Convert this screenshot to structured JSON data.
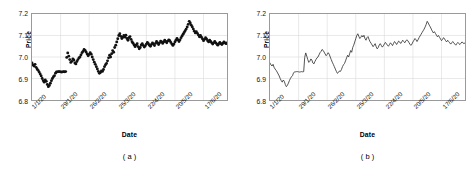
{
  "figure": {
    "panels": [
      {
        "id": "a",
        "caption": "( a )",
        "chart_index": 0
      },
      {
        "id": "b",
        "caption": "( b )",
        "chart_index": 1
      }
    ]
  },
  "axis": {
    "ylabel": "Price",
    "xlabel": "Date",
    "yticks": [
      "7.2",
      "7.1",
      "7.0",
      "6.9",
      "6.8"
    ],
    "ytick_values": [
      7.2,
      7.1,
      7.0,
      6.9,
      6.8
    ],
    "xticks": [
      "1/1/20",
      "29/1/20",
      "26/2/20",
      "25/3/20",
      "22/4/20",
      "20/5/20",
      "17/6/20"
    ],
    "xtick_indices": [
      0,
      28,
      56,
      84,
      112,
      140,
      168
    ],
    "ylim": [
      6.8,
      7.2
    ],
    "xlim": [
      0,
      196
    ],
    "grid": true,
    "grid_color": "#d9d9d9",
    "frame_color": "#9a9a9a",
    "marker_color": "#111111",
    "line_color": "#333333"
  },
  "chart_data": [
    {
      "type": "scatter",
      "title": "",
      "subtitle": "",
      "xlabel": "Date",
      "ylabel": "Price",
      "ylim": [
        6.8,
        7.2
      ],
      "grid": true,
      "legend": "none",
      "categories": [
        "1/1/20",
        "29/1/20",
        "26/2/20",
        "25/3/20",
        "22/4/20",
        "20/5/20",
        "17/6/20"
      ],
      "x": [
        0,
        1,
        2,
        3,
        4,
        5,
        6,
        7,
        8,
        9,
        10,
        11,
        12,
        13,
        14,
        15,
        16,
        17,
        18,
        19,
        20,
        21,
        22,
        23,
        24,
        25,
        26,
        27,
        28,
        29,
        30,
        31,
        32,
        33,
        34,
        35,
        36,
        37,
        38,
        39,
        40,
        41,
        42,
        43,
        44,
        45,
        46,
        47,
        48,
        49,
        50,
        51,
        52,
        53,
        54,
        55,
        56,
        57,
        58,
        59,
        60,
        61,
        62,
        63,
        64,
        65,
        66,
        67,
        68,
        69,
        70,
        71,
        72,
        73,
        74,
        75,
        76,
        77,
        78,
        79,
        80,
        81,
        82,
        83,
        84,
        85,
        86,
        87,
        88,
        89,
        90,
        91,
        92,
        93,
        94,
        95,
        96,
        97,
        98,
        99,
        100,
        101,
        102,
        103,
        104,
        105,
        106,
        107,
        108,
        109,
        110,
        111,
        112,
        113,
        114,
        115,
        116,
        117,
        118,
        119,
        120,
        121,
        122,
        123,
        124,
        125,
        126,
        127,
        128,
        129,
        130,
        131,
        132,
        133,
        134,
        135,
        136,
        137,
        138,
        139,
        140,
        141,
        142,
        143,
        144,
        145,
        146,
        147,
        148,
        149,
        150,
        151,
        152,
        153,
        154,
        155,
        156,
        157,
        158,
        159,
        160,
        161,
        162,
        163,
        164,
        165,
        166,
        167,
        168,
        169,
        170,
        171,
        172,
        173,
        174,
        175,
        176,
        177,
        178,
        179,
        180,
        181,
        182,
        183,
        184,
        185,
        186,
        187,
        188,
        189,
        190,
        191,
        192,
        193,
        194,
        195
      ],
      "values": [
        6.972,
        6.963,
        6.958,
        6.966,
        6.952,
        6.944,
        6.938,
        6.93,
        6.921,
        6.912,
        6.9,
        6.89,
        6.883,
        6.893,
        6.887,
        6.872,
        6.862,
        6.868,
        6.878,
        6.89,
        6.9,
        6.908,
        6.913,
        6.925,
        6.931,
        6.931,
        6.932,
        6.932,
        6.931,
        6.93,
        6.931,
        6.932,
        6.931,
        6.932,
        6.998,
        7.019,
        7.004,
        6.988,
        6.975,
        6.98,
        6.991,
        6.986,
        6.972,
        6.968,
        6.979,
        6.988,
        6.996,
        7.0,
        7.01,
        7.02,
        7.026,
        7.035,
        7.031,
        7.023,
        7.014,
        7.006,
        7.012,
        7.02,
        7.013,
        7.0,
        6.988,
        6.976,
        6.966,
        6.955,
        6.944,
        6.933,
        6.924,
        6.928,
        6.935,
        6.933,
        6.942,
        6.955,
        6.964,
        6.97,
        6.982,
        6.996,
        7.008,
        7.0,
        7.015,
        7.03,
        7.022,
        7.044,
        7.055,
        7.07,
        7.085,
        7.1,
        7.108,
        7.096,
        7.086,
        7.092,
        7.1,
        7.093,
        7.101,
        7.086,
        7.078,
        7.09,
        7.095,
        7.082,
        7.071,
        7.064,
        7.056,
        7.048,
        7.055,
        7.062,
        7.048,
        7.038,
        7.044,
        7.056,
        7.062,
        7.054,
        7.046,
        7.052,
        7.06,
        7.068,
        7.062,
        7.055,
        7.05,
        7.058,
        7.066,
        7.06,
        7.053,
        7.063,
        7.072,
        7.066,
        7.058,
        7.066,
        7.074,
        7.07,
        7.063,
        7.07,
        7.078,
        7.072,
        7.066,
        7.074,
        7.08,
        7.076,
        7.068,
        7.06,
        7.054,
        7.06,
        7.07,
        7.078,
        7.086,
        7.08,
        7.072,
        7.08,
        7.09,
        7.098,
        7.106,
        7.114,
        7.122,
        7.13,
        7.14,
        7.152,
        7.166,
        7.158,
        7.148,
        7.14,
        7.13,
        7.12,
        7.112,
        7.118,
        7.11,
        7.102,
        7.094,
        7.1,
        7.092,
        7.084,
        7.076,
        7.082,
        7.09,
        7.084,
        7.076,
        7.07,
        7.078,
        7.072,
        7.066,
        7.06,
        7.066,
        7.072,
        7.066,
        7.06,
        7.055,
        7.062,
        7.068,
        7.062,
        7.058,
        7.064,
        7.07,
        7.066,
        7.062,
        7.066
      ]
    },
    {
      "type": "line",
      "title": "",
      "subtitle": "",
      "xlabel": "Date",
      "ylabel": "Price",
      "ylim": [
        6.8,
        7.2
      ],
      "grid": true,
      "legend": "none",
      "categories": [
        "1/1/20",
        "29/1/20",
        "26/2/20",
        "25/3/20",
        "22/4/20",
        "20/5/20",
        "17/6/20"
      ],
      "x": [
        0,
        1,
        2,
        3,
        4,
        5,
        6,
        7,
        8,
        9,
        10,
        11,
        12,
        13,
        14,
        15,
        16,
        17,
        18,
        19,
        20,
        21,
        22,
        23,
        24,
        25,
        26,
        27,
        28,
        29,
        30,
        31,
        32,
        33,
        34,
        35,
        36,
        37,
        38,
        39,
        40,
        41,
        42,
        43,
        44,
        45,
        46,
        47,
        48,
        49,
        50,
        51,
        52,
        53,
        54,
        55,
        56,
        57,
        58,
        59,
        60,
        61,
        62,
        63,
        64,
        65,
        66,
        67,
        68,
        69,
        70,
        71,
        72,
        73,
        74,
        75,
        76,
        77,
        78,
        79,
        80,
        81,
        82,
        83,
        84,
        85,
        86,
        87,
        88,
        89,
        90,
        91,
        92,
        93,
        94,
        95,
        96,
        97,
        98,
        99,
        100,
        101,
        102,
        103,
        104,
        105,
        106,
        107,
        108,
        109,
        110,
        111,
        112,
        113,
        114,
        115,
        116,
        117,
        118,
        119,
        120,
        121,
        122,
        123,
        124,
        125,
        126,
        127,
        128,
        129,
        130,
        131,
        132,
        133,
        134,
        135,
        136,
        137,
        138,
        139,
        140,
        141,
        142,
        143,
        144,
        145,
        146,
        147,
        148,
        149,
        150,
        151,
        152,
        153,
        154,
        155,
        156,
        157,
        158,
        159,
        160,
        161,
        162,
        163,
        164,
        165,
        166,
        167,
        168,
        169,
        170,
        171,
        172,
        173,
        174,
        175,
        176,
        177,
        178,
        179,
        180,
        181,
        182,
        183,
        184,
        185,
        186,
        187,
        188,
        189,
        190,
        191,
        192,
        193,
        194,
        195
      ],
      "values": [
        6.972,
        6.963,
        6.958,
        6.966,
        6.952,
        6.944,
        6.938,
        6.93,
        6.921,
        6.912,
        6.9,
        6.89,
        6.883,
        6.893,
        6.887,
        6.872,
        6.862,
        6.868,
        6.878,
        6.89,
        6.9,
        6.908,
        6.913,
        6.925,
        6.931,
        6.931,
        6.932,
        6.932,
        6.931,
        6.93,
        6.931,
        6.932,
        6.931,
        6.932,
        6.998,
        7.019,
        7.004,
        6.988,
        6.975,
        6.98,
        6.991,
        6.986,
        6.972,
        6.968,
        6.979,
        6.988,
        6.996,
        7.0,
        7.01,
        7.02,
        7.026,
        7.035,
        7.031,
        7.023,
        7.014,
        7.006,
        7.012,
        7.02,
        7.013,
        7.0,
        6.988,
        6.976,
        6.966,
        6.955,
        6.944,
        6.933,
        6.924,
        6.928,
        6.935,
        6.933,
        6.942,
        6.955,
        6.964,
        6.97,
        6.982,
        6.996,
        7.008,
        7.0,
        7.015,
        7.03,
        7.022,
        7.044,
        7.055,
        7.07,
        7.085,
        7.1,
        7.108,
        7.096,
        7.086,
        7.092,
        7.1,
        7.093,
        7.101,
        7.086,
        7.078,
        7.09,
        7.095,
        7.082,
        7.071,
        7.064,
        7.056,
        7.048,
        7.055,
        7.062,
        7.048,
        7.038,
        7.044,
        7.056,
        7.062,
        7.054,
        7.046,
        7.052,
        7.06,
        7.068,
        7.062,
        7.055,
        7.05,
        7.058,
        7.066,
        7.06,
        7.053,
        7.063,
        7.072,
        7.066,
        7.058,
        7.066,
        7.074,
        7.07,
        7.063,
        7.07,
        7.078,
        7.072,
        7.066,
        7.074,
        7.08,
        7.076,
        7.068,
        7.06,
        7.054,
        7.06,
        7.07,
        7.078,
        7.086,
        7.08,
        7.072,
        7.08,
        7.09,
        7.098,
        7.106,
        7.114,
        7.122,
        7.13,
        7.14,
        7.152,
        7.166,
        7.158,
        7.148,
        7.14,
        7.13,
        7.12,
        7.112,
        7.118,
        7.11,
        7.102,
        7.094,
        7.1,
        7.092,
        7.084,
        7.076,
        7.082,
        7.09,
        7.084,
        7.076,
        7.07,
        7.078,
        7.072,
        7.066,
        7.06,
        7.066,
        7.072,
        7.066,
        7.06,
        7.055,
        7.062,
        7.068,
        7.062,
        7.058,
        7.064,
        7.07,
        7.066,
        7.062,
        7.066
      ]
    }
  ]
}
